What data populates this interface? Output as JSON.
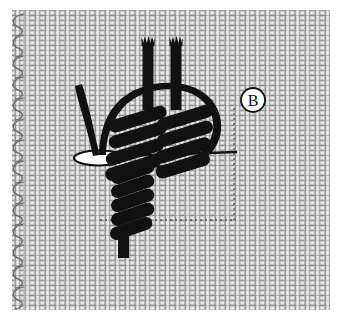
{
  "figure": {
    "label": "B",
    "label_shape": "circle",
    "background_color": "#ffffff",
    "canvas_size": {
      "width": 360,
      "height": 336
    }
  },
  "fabric": {
    "name": "even-weave canvas mesh",
    "weave_type": "plain basket weave",
    "thread_color_light": "#e8e8e8",
    "thread_color_mid": "#bdbdbd",
    "thread_color_dark": "#8d8d8d",
    "outline_color": "#6e6e6e",
    "mesh_pitch_px": 10,
    "thread_width_px": 4.4,
    "area": {
      "x": 12,
      "y": 10,
      "width": 318,
      "height": 300
    },
    "selvedge": {
      "name": "looped selvedge edge",
      "side": "left",
      "loop_count": 14,
      "loop_color": "#707070"
    }
  },
  "stitch": {
    "thread_color": "#111111",
    "elements": [
      {
        "name": "thread-tail-left",
        "kind": "vertical-stub-frayed",
        "x": 148,
        "y_top": 38,
        "y_bottom": 104
      },
      {
        "name": "thread-tail-right",
        "kind": "vertical-stub-frayed",
        "x": 176,
        "y_top": 38,
        "y_bottom": 104
      },
      {
        "name": "needle-shaft",
        "kind": "curved-needle",
        "description": "needle arcing right and entering the fabric"
      },
      {
        "name": "needle-entry-hole",
        "kind": "ellipse",
        "cx": 98,
        "cy": 158,
        "rx": 24,
        "ry": 7
      },
      {
        "name": "coil-upper-left",
        "kind": "wrapped-coil",
        "wrap_count": 5
      },
      {
        "name": "coil-upper-right",
        "kind": "wrapped-coil",
        "wrap_count": 4
      },
      {
        "name": "coil-lower",
        "kind": "wrapped-coil",
        "wrap_count": 6
      },
      {
        "name": "thread-tail-bottom",
        "kind": "straight-tail",
        "x": 124,
        "y_top": 232,
        "y_bottom": 258
      }
    ]
  },
  "guides": {
    "name": "placement guide lines",
    "color": "#3a3a3a",
    "style": "dashed",
    "horizontal": [
      {
        "name": "guide-top",
        "x1": 92,
        "x2": 236,
        "y": 156
      },
      {
        "name": "guide-bottom",
        "x1": 100,
        "x2": 236,
        "y": 220
      }
    ],
    "vertical": [
      {
        "name": "guide-right",
        "x": 234,
        "y1": 108,
        "y2": 222
      }
    ]
  }
}
